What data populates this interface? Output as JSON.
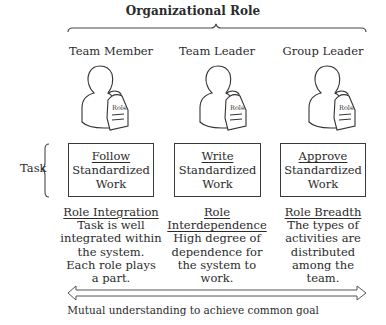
{
  "title": "Organizational Role",
  "roles": [
    {
      "name": "Team Member",
      "badge": "Role"
    },
    {
      "name": "Team Leader",
      "badge": "Role"
    },
    {
      "name": "Group Leader",
      "badge": "Role"
    }
  ],
  "task_label": "Task",
  "tasks": [
    {
      "verb": "Follow",
      "line2": "Standardized",
      "line3": "Work"
    },
    {
      "verb": "Write",
      "line2": "Standardized",
      "line3": "Work"
    },
    {
      "verb": "Approve",
      "line2": "Standardized",
      "line3": "Work"
    }
  ],
  "descriptions": [
    {
      "heading": [
        "Role Integration"
      ],
      "body": [
        "Task is well",
        "integrated within",
        "the system.",
        "Each role plays",
        "a part."
      ]
    },
    {
      "heading": [
        "Role",
        "Interdependence"
      ],
      "body": [
        "High degree of",
        "dependence for",
        "the system to",
        "work."
      ]
    },
    {
      "heading": [
        "Role Breadth"
      ],
      "body": [
        "The types of",
        "activities are",
        "distributed",
        "among the",
        "team."
      ]
    }
  ],
  "footer": "Mutual understanding to achieve common goal",
  "colors": {
    "stroke": "#3a3a3a",
    "text": "#2b2b2b",
    "background": "#ffffff"
  }
}
